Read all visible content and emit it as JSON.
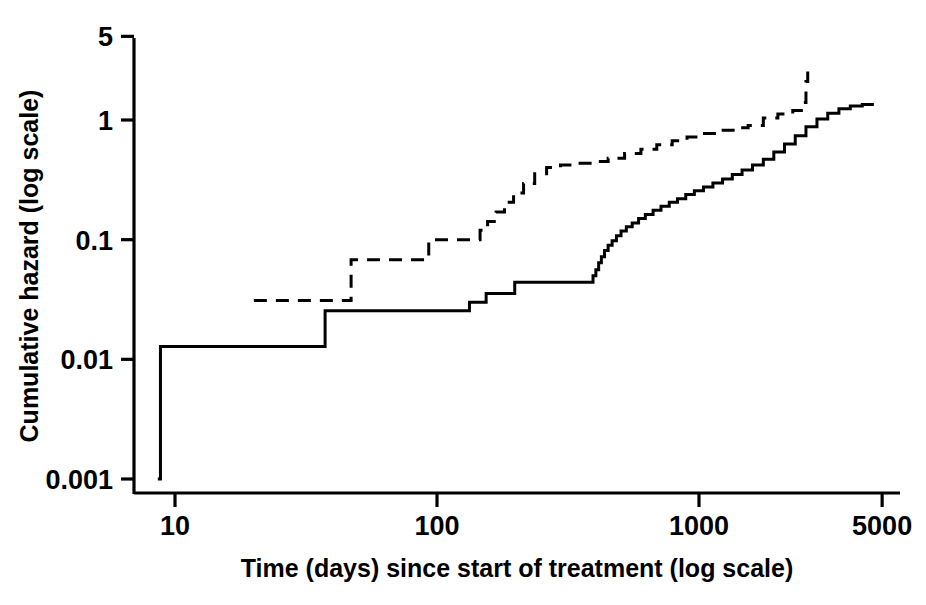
{
  "chart_data": {
    "type": "line",
    "title": "",
    "xlabel": "Time (days) since start of treatment (log scale)",
    "ylabel": "Cumulative hazard (log scale)",
    "xscale": "log",
    "yscale": "log",
    "xlim": [
      8,
      6000
    ],
    "ylim": [
      0.001,
      5.5
    ],
    "xticks": [
      10,
      100,
      1000,
      5000
    ],
    "xticklabels": [
      "10",
      "100",
      "1000",
      "5000"
    ],
    "yticks": [
      0.001,
      0.01,
      0.1,
      1,
      5
    ],
    "yticklabels": [
      "0.001",
      "0.01",
      "0.1",
      "1",
      "5"
    ],
    "grid": false,
    "legend": "none",
    "drawstyle": "steps-post",
    "series": [
      {
        "name": "solid-curve",
        "linestyle": "solid",
        "color": "#000000",
        "points": [
          [
            8.6,
            0.001
          ],
          [
            8.8,
            0.0128
          ],
          [
            37.0,
            0.0128
          ],
          [
            37.4,
            0.0255
          ],
          [
            131.0,
            0.0255
          ],
          [
            133.0,
            0.03
          ],
          [
            152.0,
            0.03
          ],
          [
            154.0,
            0.0355
          ],
          [
            196.0,
            0.0355
          ],
          [
            198.0,
            0.044
          ],
          [
            390.0,
            0.044
          ],
          [
            394.0,
            0.05
          ],
          [
            404.0,
            0.056
          ],
          [
            414.0,
            0.064
          ],
          [
            424.0,
            0.072
          ],
          [
            436.0,
            0.081
          ],
          [
            450.0,
            0.09
          ],
          [
            466.0,
            0.098
          ],
          [
            484.0,
            0.108
          ],
          [
            504.0,
            0.118
          ],
          [
            528.0,
            0.128
          ],
          [
            556.0,
            0.138
          ],
          [
            588.0,
            0.15
          ],
          [
            624.0,
            0.162
          ],
          [
            668.0,
            0.176
          ],
          [
            716.0,
            0.19
          ],
          [
            770.0,
            0.205
          ],
          [
            828.0,
            0.22
          ],
          [
            890.0,
            0.238
          ],
          [
            960.0,
            0.256
          ],
          [
            1040.0,
            0.276
          ],
          [
            1130.0,
            0.298
          ],
          [
            1230.0,
            0.322
          ],
          [
            1340.0,
            0.35
          ],
          [
            1460.0,
            0.382
          ],
          [
            1600.0,
            0.42
          ],
          [
            1760.0,
            0.47
          ],
          [
            1930.0,
            0.54
          ],
          [
            2120.0,
            0.63
          ],
          [
            2330.0,
            0.74
          ],
          [
            2560.0,
            0.88
          ],
          [
            2820.0,
            1.02
          ],
          [
            3100.0,
            1.14
          ],
          [
            3420.0,
            1.24
          ],
          [
            3780.0,
            1.31
          ],
          [
            4200.0,
            1.35
          ],
          [
            4650.0,
            1.35
          ]
        ]
      },
      {
        "name": "dashed-curve",
        "linestyle": "dashed",
        "color": "#000000",
        "points": [
          [
            20.0,
            0.031
          ],
          [
            46.0,
            0.031
          ],
          [
            47.0,
            0.068
          ],
          [
            91.0,
            0.068
          ],
          [
            93.0,
            0.1
          ],
          [
            143.0,
            0.1
          ],
          [
            146.0,
            0.12
          ],
          [
            156.0,
            0.142
          ],
          [
            168.0,
            0.17
          ],
          [
            181.0,
            0.205
          ],
          [
            196.0,
            0.245
          ],
          [
            214.0,
            0.295
          ],
          [
            236.0,
            0.355
          ],
          [
            262.0,
            0.4
          ],
          [
            296.0,
            0.42
          ],
          [
            340.0,
            0.435
          ],
          [
            390.0,
            0.45
          ],
          [
            450.0,
            0.48
          ],
          [
            520.0,
            0.525
          ],
          [
            600.0,
            0.57
          ],
          [
            690.0,
            0.62
          ],
          [
            790.0,
            0.67
          ],
          [
            900.0,
            0.72
          ],
          [
            1030.0,
            0.77
          ],
          [
            1180.0,
            0.82
          ],
          [
            1350.0,
            0.86
          ],
          [
            1540.0,
            0.9
          ],
          [
            1760.0,
            1.04
          ],
          [
            2000.0,
            1.12
          ],
          [
            2280.0,
            1.2
          ],
          [
            2500.0,
            1.4
          ],
          [
            2560.0,
            2.1
          ],
          [
            2600.0,
            2.8
          ]
        ]
      }
    ]
  },
  "axes": {
    "x_title": "Time (days) since start of treatment (log scale)",
    "y_title": "Cumulative hazard (log scale)",
    "x_tick_labels": [
      "10",
      "100",
      "1000",
      "5000"
    ],
    "y_tick_labels": [
      "0.001",
      "0.01",
      "0.1",
      "1",
      "5"
    ]
  }
}
